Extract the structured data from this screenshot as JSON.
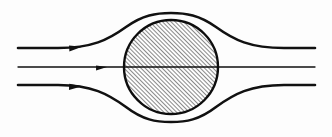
{
  "figure": {
    "title": "Streamline flow past a circular body",
    "type": "fluid-flow-diagram",
    "background_color": "#fdfdfd",
    "ink_color": "#111111",
    "canvas": {
      "width": 332,
      "height": 137
    }
  },
  "body_shape": {
    "name": "hatched-circle",
    "label": "solid circular body",
    "center_x": 171,
    "center_y": 67,
    "radius": 47,
    "outline_color": "#0d0d0d",
    "outline_width": 2.4,
    "hatch_pattern": "diagonal-45-up",
    "hatch_spacing": 3.0,
    "hatch_color": "#161616",
    "hatch_width": 1.0
  },
  "streamlines": [
    {
      "name": "upper-streamline",
      "label": "upper streamline",
      "inlet_y": 48,
      "outlet_y": 48,
      "peak_y": 13,
      "stroke_width": 2.6,
      "path": "M 18 48 L 58 48 C 92 48 108 40 126 27 C 143 15 156 13 171 13 C 186 13 199 15 216 27 C 234 40 250 48 284 48 L 315 48"
    },
    {
      "name": "center-streamline",
      "label": "centerline stagnation streamline",
      "inlet_y": 67,
      "outlet_y": 67,
      "peak_y": 67,
      "stroke_width": 1.3,
      "path": "M 18 67 L 315 67"
    },
    {
      "name": "lower-streamline",
      "label": "lower streamline",
      "inlet_y": 85,
      "outlet_y": 85,
      "peak_y": 122,
      "stroke_width": 2.6,
      "path": "M 18 85 L 58 85 C 92 85 108 94 126 107 C 143 120 156 122 171 122 C 186 122 199 120 216 107 C 234 94 250 85 284 85 L 315 85"
    }
  ],
  "arrows": [
    {
      "name": "upper-flow-arrow",
      "label": "flow direction arrow (upper)",
      "x": 75,
      "y": 47,
      "angle_deg": -3,
      "length": 13,
      "half_width": 4.2
    },
    {
      "name": "center-flow-arrow",
      "label": "flow direction arrow (center)",
      "x": 101,
      "y": 67,
      "angle_deg": 0,
      "length": 11,
      "half_width": 3.4
    },
    {
      "name": "lower-flow-arrow",
      "label": "flow direction arrow (lower)",
      "x": 75,
      "y": 86,
      "angle_deg": 3,
      "length": 13,
      "half_width": 4.2
    }
  ]
}
